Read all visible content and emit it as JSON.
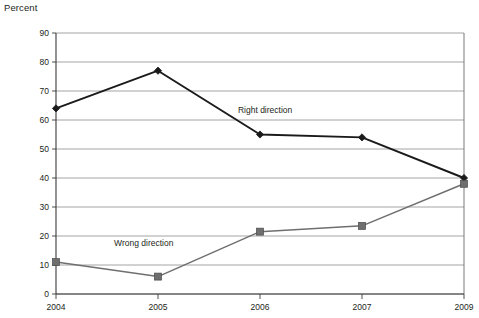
{
  "chart": {
    "y_axis_title": "Percent"
  },
  "chart_data": {
    "type": "line",
    "title": "",
    "subtitle": "",
    "xlabel": "",
    "ylabel": "Percent",
    "categories": [
      "2004",
      "2005",
      "2006",
      "2007",
      "2009"
    ],
    "ylim": [
      0,
      90
    ],
    "ytick_labels": [
      "0",
      "10",
      "20",
      "30",
      "40",
      "50",
      "60",
      "70",
      "80",
      "90"
    ],
    "yticks": [
      0,
      10,
      20,
      30,
      40,
      50,
      60,
      70,
      80,
      90
    ],
    "grid": true,
    "legend_position": "inline-annotations",
    "series": [
      {
        "name": "Right direction",
        "values": [
          64,
          77,
          55,
          54,
          40
        ],
        "color": "#1a1a1a",
        "marker": "diamond",
        "annotation": "Right direction"
      },
      {
        "name": "Wrong direction",
        "values": [
          11,
          6,
          21.5,
          23.5,
          38
        ],
        "color": "#6f6f6f",
        "marker": "square",
        "annotation": "Wrong direction"
      }
    ],
    "annotations": [
      {
        "text": "Right direction",
        "x": 2.05,
        "y": 62.5
      },
      {
        "text": "Wrong direction",
        "x": 0.86,
        "y": 16.5
      }
    ]
  }
}
